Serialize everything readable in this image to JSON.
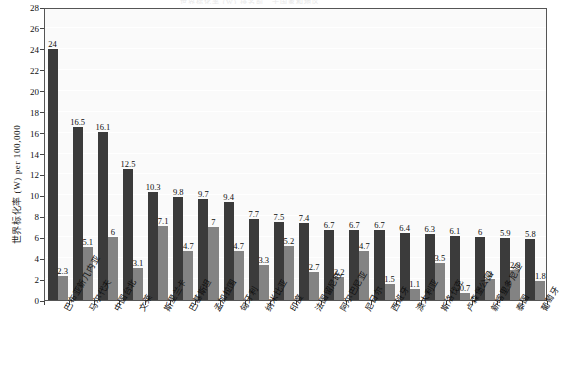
{
  "chart": {
    "title": "世界标化率 (W) 排名前二十国家和地区",
    "ylabel": "世界标化率 (W) per 100,000",
    "xlabel": ""
  },
  "chart_data": {
    "type": "bar",
    "title": "世界标化率 (W) 排名前二十国家和地区",
    "xlabel": "",
    "ylabel": "世界标化率 (W) per 100,000",
    "ylim": [
      0,
      28
    ],
    "yticks": [
      0,
      2,
      4,
      6,
      8,
      10,
      12,
      14,
      16,
      18,
      20,
      22,
      24,
      26,
      28
    ],
    "grid": true,
    "legend": "none",
    "categories": [
      "巴布亚新几内亚",
      "马尔代夫",
      "中国台北",
      "文莱",
      "斯里兰卡",
      "巴基斯坦",
      "孟加拉国",
      "匈牙利",
      "纳米比亚",
      "印度",
      "法国留尼旺",
      "阿尔巴尼亚",
      "尼日尔",
      "西班牙",
      "澳大利亚",
      "斯洛伐克",
      "卢森堡公园",
      "新喀里多尼亚",
      "泰国",
      "葡萄牙"
    ],
    "series": [
      {
        "name": "series-1",
        "color": "#3b3b3b",
        "values": [
          24,
          16.5,
          16.1,
          12.5,
          10.3,
          9.8,
          9.7,
          9.4,
          7.7,
          7.5,
          7.4,
          6.7,
          6.7,
          6.7,
          6.4,
          6.3,
          6.1,
          6,
          5.9,
          5.8
        ]
      },
      {
        "name": "series-2",
        "color": "#838383",
        "values": [
          2.3,
          5.1,
          6,
          3.1,
          7.1,
          4.7,
          7,
          4.7,
          3.3,
          5.2,
          2.7,
          2.2,
          4.7,
          1.5,
          1.1,
          3.5,
          0.7,
          2,
          2.9,
          1.8
        ]
      }
    ],
    "labels": {
      "series-1": [
        "24",
        "16.5",
        "16.1",
        "12.5",
        "10.3",
        "9.8",
        "9.7",
        "9.4",
        "7.7",
        "7.5",
        "7.4",
        "6.7",
        "6.7",
        "6.7",
        "6.4",
        "6.3",
        "6.1",
        "6",
        "5.9",
        "5.8"
      ],
      "series-2": [
        "2.3",
        "5.1",
        "6",
        "3.1",
        "7.1",
        "4.7",
        "7",
        "4.7",
        "3.3",
        "5.2",
        "2.7",
        "2.2",
        "4.7",
        "1.5",
        "1.1",
        "3.5",
        "0.7",
        "2",
        "2.9",
        "1.8"
      ]
    }
  },
  "colors": {
    "bar_dark": "#3b3b3b",
    "bar_light": "#838383",
    "plot_bg": "#fafafa",
    "grid": "#ffffff",
    "axis": "#555555",
    "text": "#0f0f0f"
  }
}
